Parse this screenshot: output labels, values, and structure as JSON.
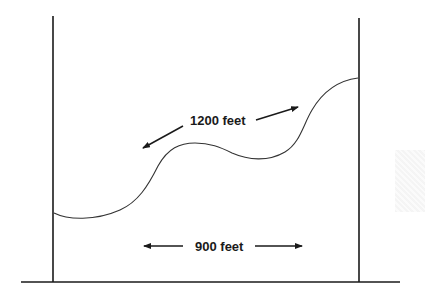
{
  "diagram": {
    "type": "cable-span-illustration",
    "cable_length_label": "1200 feet",
    "span_label": "900 feet",
    "colors": {
      "line": "#1a1a1a",
      "curve": "#333333",
      "background": "#ffffff"
    },
    "icons": {
      "cable_arrow_left": "arrow-down-left",
      "cable_arrow_right": "arrow-up-right",
      "span_arrow_left": "arrow-left",
      "span_arrow_right": "arrow-right"
    }
  }
}
